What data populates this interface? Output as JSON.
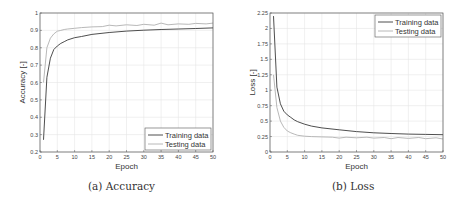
{
  "chart_data": [
    {
      "id": "accuracy",
      "type": "line",
      "caption": "(a) Accuracy",
      "title": "",
      "xlabel": "Epoch",
      "ylabel": "Accuracy [-]",
      "xlim": [
        0,
        50
      ],
      "ylim": [
        0.2,
        1
      ],
      "xticks": [
        0,
        5,
        10,
        15,
        20,
        25,
        30,
        35,
        40,
        45,
        50
      ],
      "yticks": [
        0.2,
        0.3,
        0.4,
        0.5,
        0.6,
        0.7,
        0.8,
        0.9,
        1
      ],
      "ytick_labels": [
        "0.2",
        "0.3",
        "0.4",
        "0.5",
        "0.6",
        "0.7",
        "0.8",
        "0.9",
        "1"
      ],
      "grid": true,
      "legend_position": "lower right",
      "series": [
        {
          "name": "Training data",
          "color": "#3a3a3a",
          "x": [
            1,
            2,
            3,
            4,
            5,
            6,
            7,
            8,
            10,
            12,
            15,
            20,
            25,
            30,
            35,
            40,
            45,
            50
          ],
          "y": [
            0.27,
            0.63,
            0.74,
            0.79,
            0.81,
            0.825,
            0.835,
            0.845,
            0.858,
            0.865,
            0.877,
            0.888,
            0.896,
            0.901,
            0.905,
            0.908,
            0.911,
            0.914
          ]
        },
        {
          "name": "Testing data",
          "color": "#b0b0b0",
          "x": [
            1,
            2,
            3,
            4,
            5,
            6,
            7,
            8,
            10,
            12,
            15,
            18,
            20,
            22,
            25,
            28,
            30,
            33,
            35,
            37,
            40,
            43,
            45,
            48,
            50
          ],
          "y": [
            0.6,
            0.8,
            0.855,
            0.88,
            0.895,
            0.9,
            0.905,
            0.908,
            0.912,
            0.916,
            0.92,
            0.922,
            0.93,
            0.926,
            0.932,
            0.928,
            0.935,
            0.93,
            0.942,
            0.932,
            0.937,
            0.935,
            0.94,
            0.937,
            0.942
          ]
        }
      ]
    },
    {
      "id": "loss",
      "type": "line",
      "caption": "(b) Loss",
      "title": "",
      "xlabel": "Epoch",
      "ylabel": "Loss [-]",
      "xlim": [
        0,
        50
      ],
      "ylim": [
        0,
        2.25
      ],
      "xticks": [
        0,
        5,
        10,
        15,
        20,
        25,
        30,
        35,
        40,
        45,
        50
      ],
      "yticks": [
        0,
        0.25,
        0.5,
        0.75,
        1,
        1.25,
        1.5,
        1.75,
        2,
        2.25
      ],
      "ytick_labels": [
        "0",
        "0.25",
        "0.5",
        "0.75",
        "1",
        "1.25",
        "1.5",
        "1.75",
        "2",
        "2.25"
      ],
      "grid": true,
      "legend_position": "upper right",
      "series": [
        {
          "name": "Training data",
          "color": "#3a3a3a",
          "x": [
            1,
            2,
            3,
            4,
            5,
            6,
            7,
            8,
            10,
            12,
            15,
            20,
            25,
            30,
            35,
            40,
            45,
            50
          ],
          "y": [
            2.2,
            1.05,
            0.78,
            0.66,
            0.6,
            0.56,
            0.52,
            0.49,
            0.45,
            0.42,
            0.39,
            0.36,
            0.33,
            0.31,
            0.3,
            0.29,
            0.285,
            0.28
          ]
        },
        {
          "name": "Testing data",
          "color": "#b0b0b0",
          "x": [
            1,
            2,
            3,
            4,
            5,
            6,
            7,
            8,
            10,
            12,
            15,
            18,
            20,
            22,
            25,
            28,
            30,
            33,
            35,
            37,
            40,
            43,
            45,
            48,
            50
          ],
          "y": [
            1.25,
            0.72,
            0.5,
            0.4,
            0.34,
            0.31,
            0.29,
            0.27,
            0.255,
            0.25,
            0.245,
            0.24,
            0.225,
            0.24,
            0.23,
            0.24,
            0.225,
            0.235,
            0.215,
            0.235,
            0.22,
            0.235,
            0.215,
            0.23,
            0.21
          ]
        }
      ]
    }
  ]
}
